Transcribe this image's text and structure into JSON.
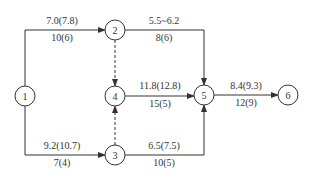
{
  "diagram": {
    "type": "network-diagram",
    "colors": {
      "stroke": "#333333",
      "background": "#ffffff"
    },
    "nodes": [
      {
        "id": "1",
        "label": "1"
      },
      {
        "id": "2",
        "label": "2"
      },
      {
        "id": "3",
        "label": "3"
      },
      {
        "id": "4",
        "label": "4"
      },
      {
        "id": "5",
        "label": "5"
      },
      {
        "id": "6",
        "label": "6"
      }
    ],
    "edges": [
      {
        "from": "1",
        "to": "2",
        "style": "solid",
        "top_label": "7.0(7.8)",
        "bottom_label": "10(6)"
      },
      {
        "from": "2",
        "to": "5",
        "style": "solid",
        "top_label": "5.5~6.2",
        "bottom_label": "8(6)"
      },
      {
        "from": "1",
        "to": "3",
        "style": "solid",
        "top_label": "9.2(10.7)",
        "bottom_label": "7(4)"
      },
      {
        "from": "3",
        "to": "5",
        "style": "solid",
        "top_label": "6.5(7.5)",
        "bottom_label": "10(5)"
      },
      {
        "from": "4",
        "to": "5",
        "style": "solid",
        "top_label": "11.8(12.8)",
        "bottom_label": "15(5)"
      },
      {
        "from": "5",
        "to": "6",
        "style": "solid",
        "top_label": "8.4(9.3)",
        "bottom_label": "12(9)"
      },
      {
        "from": "2",
        "to": "4",
        "style": "dashed",
        "top_label": "",
        "bottom_label": ""
      },
      {
        "from": "3",
        "to": "4",
        "style": "dashed",
        "top_label": "",
        "bottom_label": ""
      }
    ]
  }
}
